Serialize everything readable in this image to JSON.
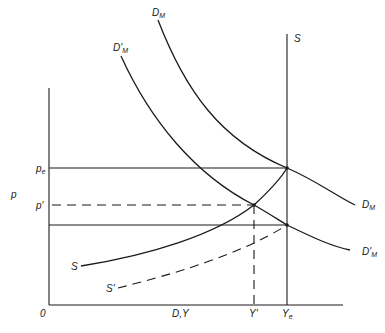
{
  "diagram": {
    "type": "supply-demand",
    "colors": {
      "ink": "#1a1a1a",
      "background": "#ffffff"
    },
    "axes": {
      "y_label": "p",
      "x_label": "D,Y",
      "origin_label": "0"
    },
    "y_ticks": [
      {
        "label": "p",
        "sub": "e"
      },
      {
        "label": "p'",
        "sub": ""
      }
    ],
    "x_ticks": [
      {
        "label": "Y'",
        "sub": ""
      },
      {
        "label": "Y",
        "sub": "e"
      }
    ],
    "curves": [
      {
        "id": "DM",
        "label": "D",
        "sub": "M",
        "style": "solid"
      },
      {
        "id": "DM_prime",
        "label": "D'",
        "sub": "M",
        "style": "solid"
      },
      {
        "id": "S_vertical",
        "label": "S",
        "sub": "",
        "style": "solid"
      },
      {
        "id": "S",
        "label": "S",
        "sub": "",
        "style": "solid"
      },
      {
        "id": "S_prime",
        "label": "S'",
        "sub": "",
        "style": "dashed"
      }
    ],
    "right_labels": [
      {
        "label": "D",
        "sub": "M"
      },
      {
        "label": "D'",
        "sub": "M"
      }
    ]
  }
}
